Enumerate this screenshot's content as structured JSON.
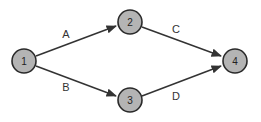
{
  "diagram": {
    "type": "directed-network",
    "nodes": [
      {
        "id": "1",
        "label": "1",
        "x": 24,
        "y": 61
      },
      {
        "id": "2",
        "label": "2",
        "x": 130,
        "y": 22
      },
      {
        "id": "3",
        "label": "3",
        "x": 130,
        "y": 100
      },
      {
        "id": "4",
        "label": "4",
        "x": 235,
        "y": 61
      }
    ],
    "edges": [
      {
        "label": "A",
        "from": "1",
        "to": "2"
      },
      {
        "label": "B",
        "from": "1",
        "to": "3"
      },
      {
        "label": "C",
        "from": "2",
        "to": "4"
      },
      {
        "label": "D",
        "from": "3",
        "to": "4"
      }
    ],
    "colors": {
      "node_fill": "#b4b4b4",
      "stroke": "#2a2a2a"
    }
  }
}
